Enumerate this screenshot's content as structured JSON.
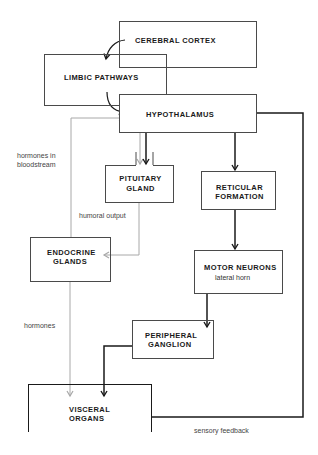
{
  "diagram": {
    "nodes": {
      "cerebral_cortex": {
        "label": "CEREBRAL  CORTEX"
      },
      "limbic_pathways": {
        "label": "LIMBIC PATHWAYS"
      },
      "hypothalamus": {
        "label": "HYPOTHALAMUS"
      },
      "pituitary_gland": {
        "line1": "PITUITARY",
        "line2": "GLAND"
      },
      "reticular_formation": {
        "line1": "RETICULAR",
        "line2": "FORMATION"
      },
      "endocrine_glands": {
        "line1": "ENDOCRINE",
        "line2": "GLANDS"
      },
      "motor_neurons": {
        "label": "MOTOR  NEURONS",
        "sublabel": "lateral horn"
      },
      "peripheral_ganglion": {
        "line1": "PERIPHERAL",
        "line2": "GANGLION"
      },
      "visceral_organs": {
        "line1": "VISCERAL",
        "line2": "ORGANS"
      }
    },
    "edge_labels": {
      "hormones_in_bloodstream_1": "hormones in",
      "hormones_in_bloodstream_2": "bloodstream",
      "humoral_output": "humoral output",
      "hormones": "hormones",
      "sensory_feedback": "sensory feedback"
    },
    "colors": {
      "neural_line": "#1a1a1a",
      "humoral_line": "#a8a8a8",
      "box_border": "#4a4a4a"
    }
  }
}
